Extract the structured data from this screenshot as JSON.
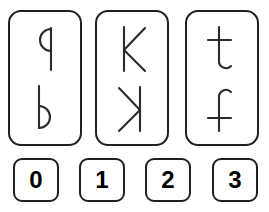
{
  "task": {
    "type": "mental-rotation-mirror-pairs",
    "card_count": 3,
    "answer_count": 4
  },
  "cards": [
    {
      "id": "card-0",
      "index": 0,
      "top_glyph": {
        "name": "letter-q",
        "label": "q",
        "transform": "none"
      },
      "bottom_glyph": {
        "name": "letter-b",
        "label": "b",
        "transform": "horizontal-mirror"
      }
    },
    {
      "id": "card-1",
      "index": 1,
      "top_glyph": {
        "name": "letter-k",
        "label": "K",
        "transform": "none"
      },
      "bottom_glyph": {
        "name": "letter-k-mirrored",
        "label": "K",
        "transform": "horizontal-mirror"
      }
    },
    {
      "id": "card-2",
      "index": 2,
      "top_glyph": {
        "name": "letter-t",
        "label": "t",
        "transform": "none"
      },
      "bottom_glyph": {
        "name": "letter-t-flipped",
        "label": "t",
        "transform": "vertical-flip"
      }
    }
  ],
  "answer_buttons": [
    {
      "value": "0",
      "name": "answer-button-0"
    },
    {
      "value": "1",
      "name": "answer-button-1"
    },
    {
      "value": "2",
      "name": "answer-button-2"
    },
    {
      "value": "3",
      "name": "answer-button-3"
    }
  ],
  "colors": {
    "background": "#ffffff",
    "card_border": "#231f20",
    "button_border": "#231f20",
    "glyph_stroke": "#2b2b2b",
    "button_text": "#000000"
  }
}
